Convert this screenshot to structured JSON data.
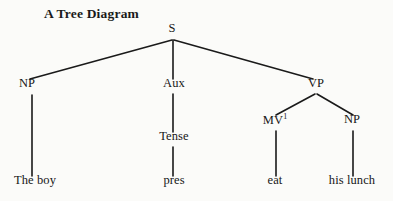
{
  "figure": {
    "title": "A Tree Diagram",
    "background_color": "#fbfbf9",
    "line_color": "#1a1a1a",
    "text_color": "#171717"
  },
  "tree": {
    "nodes": [
      {
        "id": "s",
        "label": "S",
        "sup": "",
        "x": 172,
        "y": 33,
        "level": 0
      },
      {
        "id": "np-left",
        "label": "NP",
        "sup": "",
        "x": 27,
        "y": 88,
        "level": 1
      },
      {
        "id": "aux",
        "label": "Aux",
        "sup": "",
        "x": 174,
        "y": 88,
        "level": 1
      },
      {
        "id": "vp",
        "label": "VP",
        "sup": "",
        "x": 316,
        "y": 88,
        "level": 1
      },
      {
        "id": "mv",
        "label": "MV",
        "sup": "1",
        "x": 275,
        "y": 124,
        "level": 2
      },
      {
        "id": "np-right",
        "label": "NP",
        "sup": "",
        "x": 352,
        "y": 124,
        "level": 2
      },
      {
        "id": "tense",
        "label": "Tense",
        "sup": "",
        "x": 174,
        "y": 141,
        "level": 2
      },
      {
        "id": "the-boy",
        "label": "The boy",
        "sup": "",
        "x": 35,
        "y": 185,
        "level": 3
      },
      {
        "id": "pres",
        "label": "pres",
        "sup": "",
        "x": 174,
        "y": 185,
        "level": 3
      },
      {
        "id": "eat",
        "label": "eat",
        "sup": "",
        "x": 275,
        "y": 185,
        "level": 3
      },
      {
        "id": "his-lunch",
        "label": "his lunch",
        "sup": "",
        "x": 352,
        "y": 185,
        "level": 3
      }
    ],
    "edges": [
      {
        "from": "s",
        "to": "np-left",
        "x1": 172,
        "y1": 40,
        "x2": 30,
        "y2": 79
      },
      {
        "from": "s",
        "to": "aux",
        "x1": 173,
        "y1": 40,
        "x2": 173,
        "y2": 79
      },
      {
        "from": "s",
        "to": "vp",
        "x1": 174,
        "y1": 40,
        "x2": 313,
        "y2": 79
      },
      {
        "from": "vp",
        "to": "mv",
        "x1": 315,
        "y1": 94,
        "x2": 276,
        "y2": 115
      },
      {
        "from": "vp",
        "to": "np-right",
        "x1": 317,
        "y1": 94,
        "x2": 353,
        "y2": 115
      },
      {
        "from": "aux",
        "to": "tense",
        "x1": 173,
        "y1": 94,
        "x2": 173,
        "y2": 132
      },
      {
        "from": "np-left",
        "to": "the-boy",
        "x1": 32,
        "y1": 95,
        "x2": 32,
        "y2": 176
      },
      {
        "from": "tense",
        "to": "pres",
        "x1": 173,
        "y1": 147,
        "x2": 173,
        "y2": 176
      },
      {
        "from": "mv",
        "to": "eat",
        "x1": 276,
        "y1": 131,
        "x2": 276,
        "y2": 176
      },
      {
        "from": "np-right",
        "to": "his-lunch",
        "x1": 353,
        "y1": 131,
        "x2": 353,
        "y2": 176
      }
    ]
  }
}
